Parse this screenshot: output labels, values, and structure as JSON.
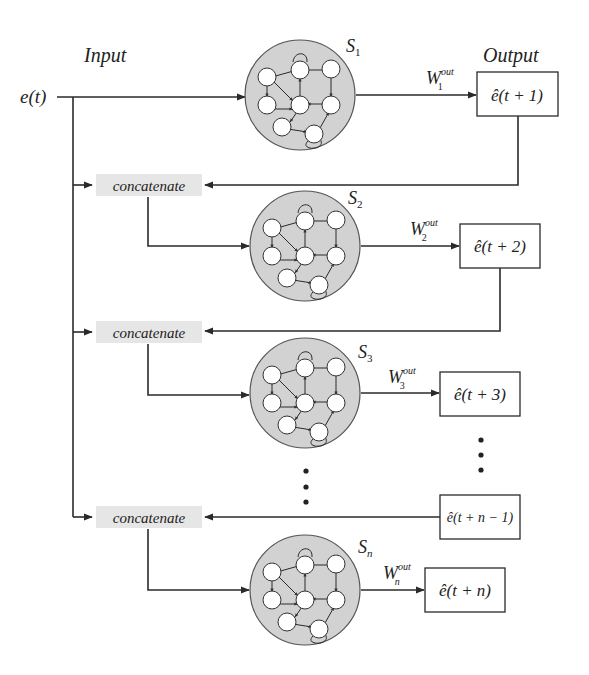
{
  "diagram": {
    "input_label": "Input",
    "output_label": "Output",
    "input_signal": "e(t)",
    "concatenate_label": "concatenate",
    "stages": [
      {
        "reservoir": "S",
        "reservoir_sub": "1",
        "weight": "W",
        "weight_sup": "out",
        "weight_sub": "1",
        "output": "ê(t + 1)"
      },
      {
        "reservoir": "S",
        "reservoir_sub": "2",
        "weight": "W",
        "weight_sup": "out",
        "weight_sub": "2",
        "output": "ê(t + 2)"
      },
      {
        "reservoir": "S",
        "reservoir_sub": "3",
        "weight": "W",
        "weight_sup": "out",
        "weight_sub": "3",
        "output": "ê(t + 3)"
      },
      {
        "reservoir": "S",
        "reservoir_sub": "n",
        "weight": "W",
        "weight_sup": "out",
        "weight_sub": "n",
        "output": "ê(t + n)"
      }
    ],
    "feedback_box": "ê(t + n − 1)",
    "ellipsis": "⋮"
  }
}
